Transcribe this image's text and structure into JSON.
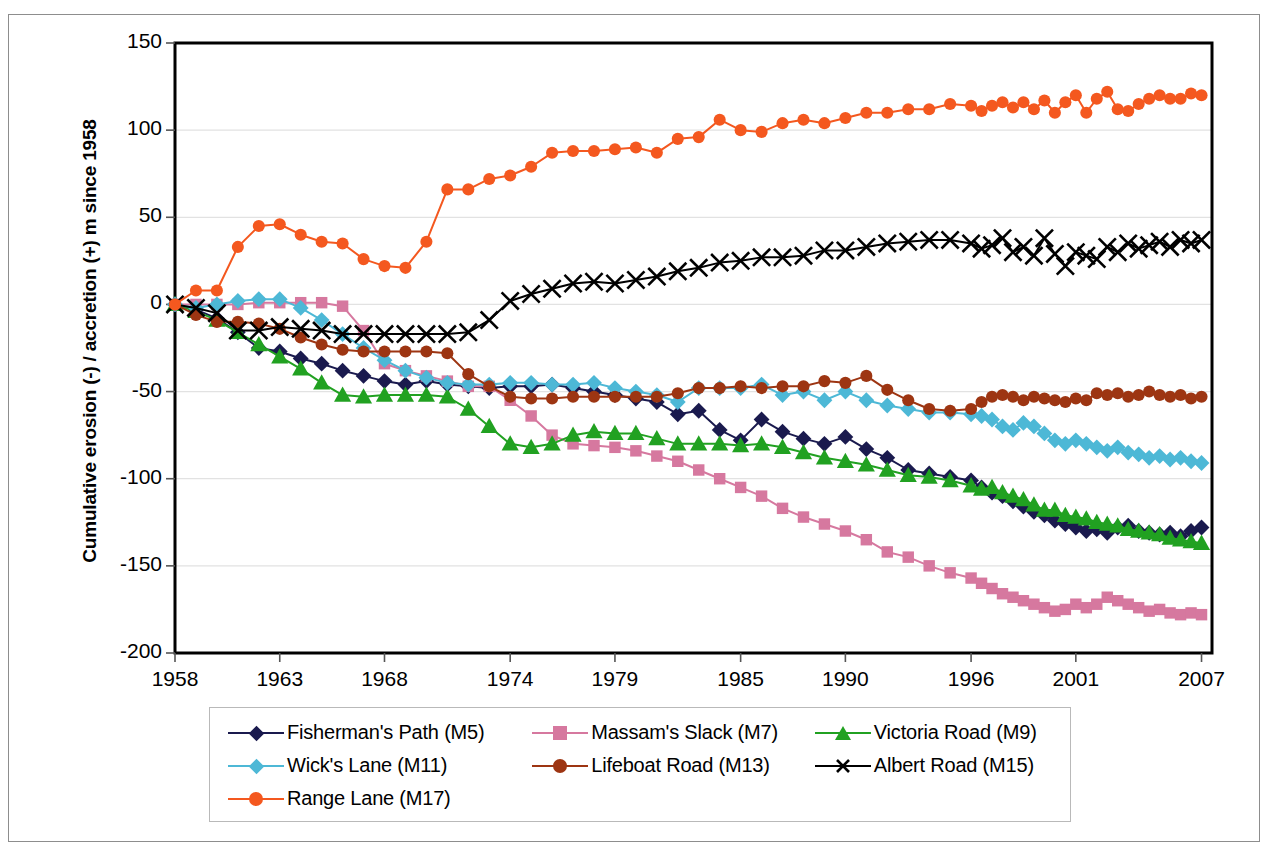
{
  "chart_data": {
    "type": "line",
    "title": "",
    "xlabel": "",
    "ylabel": "Cumulative erosion (-) / accretion (+) m since 1958",
    "xlim": [
      1958,
      2007.5
    ],
    "ylim": [
      -200,
      150
    ],
    "xticks": [
      "1958",
      "1963",
      "1968",
      "1974",
      "1979",
      "1985",
      "1990",
      "1996",
      "2001",
      "2007"
    ],
    "xtick_values": [
      1958,
      1963,
      1968,
      1974,
      1979,
      1985,
      1990,
      1996,
      2001,
      2007
    ],
    "yticks": [
      "150",
      "100",
      "50",
      "0",
      "-50",
      "-100",
      "-150",
      "-200"
    ],
    "ytick_values": [
      150,
      100,
      50,
      0,
      -50,
      -100,
      -150,
      -200
    ],
    "grid": "horizontal",
    "legend_position": "below",
    "series": [
      {
        "name": "Fisherman's Path (M5)",
        "color": "#1a1a4e",
        "marker": "diamond",
        "x": [
          1958,
          1959,
          1960,
          1961,
          1962,
          1963,
          1964,
          1965,
          1966,
          1967,
          1968,
          1969,
          1970,
          1971,
          1972,
          1973,
          1974,
          1975,
          1976,
          1977,
          1978,
          1979,
          1980,
          1981,
          1982,
          1983,
          1984,
          1985,
          1986,
          1987,
          1988,
          1989,
          1990,
          1991,
          1992,
          1993,
          1994,
          1995,
          1996,
          1996.5,
          1997,
          1997.5,
          1998,
          1998.5,
          1999,
          1999.5,
          2000,
          2000.5,
          2001,
          2001.5,
          2002,
          2002.5,
          2003,
          2003.5,
          2004,
          2004.5,
          2005,
          2005.5,
          2006,
          2006.5,
          2007
        ],
        "y": [
          0,
          -3,
          -8,
          -16,
          -25,
          -27,
          -31,
          -34,
          -38,
          -41,
          -44,
          -46,
          -44,
          -46,
          -47,
          -48,
          -47,
          -47,
          -46,
          -48,
          -50,
          -52,
          -54,
          -56,
          -63,
          -61,
          -72,
          -78,
          -66,
          -73,
          -77,
          -80,
          -76,
          -83,
          -88,
          -95,
          -97,
          -99,
          -101,
          -105,
          -108,
          -110,
          -113,
          -116,
          -119,
          -121,
          -124,
          -126,
          -128,
          -130,
          -129,
          -131,
          -128,
          -127,
          -130,
          -131,
          -132,
          -131,
          -133,
          -130,
          -128
        ]
      },
      {
        "name": "Massam's Slack (M7)",
        "color": "#d6789f",
        "marker": "square",
        "x": [
          1958,
          1959,
          1960,
          1961,
          1962,
          1963,
          1964,
          1965,
          1966,
          1967,
          1968,
          1969,
          1970,
          1971,
          1972,
          1973,
          1974,
          1975,
          1976,
          1977,
          1978,
          1979,
          1980,
          1981,
          1982,
          1983,
          1984,
          1985,
          1986,
          1987,
          1988,
          1989,
          1990,
          1991,
          1992,
          1993,
          1994,
          1995,
          1996,
          1996.5,
          1997,
          1997.5,
          1998,
          1998.5,
          1999,
          1999.5,
          2000,
          2000.5,
          2001,
          2001.5,
          2002,
          2002.5,
          2003,
          2003.5,
          2004,
          2004.5,
          2005,
          2005.5,
          2006,
          2006.5,
          2007
        ],
        "y": [
          0,
          0,
          0,
          0,
          1,
          1,
          1,
          1,
          -1,
          -15,
          -34,
          -38,
          -41,
          -44,
          -47,
          -47,
          -55,
          -64,
          -75,
          -80,
          -81,
          -82,
          -84,
          -87,
          -90,
          -95,
          -100,
          -105,
          -110,
          -117,
          -122,
          -126,
          -130,
          -135,
          -142,
          -145,
          -150,
          -154,
          -157,
          -160,
          -163,
          -166,
          -168,
          -170,
          -172,
          -174,
          -176,
          -175,
          -172,
          -174,
          -172,
          -168,
          -170,
          -172,
          -174,
          -176,
          -175,
          -177,
          -178,
          -177,
          -178
        ]
      },
      {
        "name": "Victoria Road (M9)",
        "color": "#21a121",
        "marker": "triangle",
        "x": [
          1958,
          1959,
          1960,
          1961,
          1962,
          1963,
          1964,
          1965,
          1966,
          1967,
          1968,
          1969,
          1970,
          1971,
          1972,
          1973,
          1974,
          1975,
          1976,
          1977,
          1978,
          1979,
          1980,
          1981,
          1982,
          1983,
          1984,
          1985,
          1986,
          1987,
          1988,
          1989,
          1990,
          1991,
          1992,
          1993,
          1994,
          1995,
          1996,
          1996.5,
          1997,
          1997.5,
          1998,
          1998.5,
          1999,
          1999.5,
          2000,
          2000.5,
          2001,
          2001.5,
          2002,
          2002.5,
          2003,
          2003.5,
          2004,
          2004.5,
          2005,
          2005.5,
          2006,
          2006.5,
          2007
        ],
        "y": [
          0,
          -4,
          -9,
          -16,
          -23,
          -30,
          -37,
          -45,
          -52,
          -53,
          -52,
          -52,
          -52,
          -53,
          -60,
          -70,
          -80,
          -82,
          -80,
          -75,
          -73,
          -74,
          -74,
          -77,
          -80,
          -80,
          -80,
          -81,
          -80,
          -82,
          -85,
          -88,
          -90,
          -92,
          -95,
          -98,
          -99,
          -101,
          -104,
          -106,
          -105,
          -108,
          -110,
          -112,
          -115,
          -118,
          -118,
          -121,
          -122,
          -123,
          -125,
          -126,
          -127,
          -129,
          -130,
          -131,
          -132,
          -134,
          -135,
          -136,
          -137
        ]
      },
      {
        "name": "Wick's Lane (M11)",
        "color": "#4db8d6",
        "marker": "diamond",
        "x": [
          1958,
          1959,
          1960,
          1961,
          1962,
          1963,
          1964,
          1965,
          1966,
          1967,
          1968,
          1969,
          1970,
          1971,
          1972,
          1973,
          1974,
          1975,
          1976,
          1977,
          1978,
          1979,
          1980,
          1981,
          1982,
          1983,
          1984,
          1985,
          1986,
          1987,
          1988,
          1989,
          1990,
          1991,
          1992,
          1993,
          1994,
          1995,
          1996,
          1996.5,
          1997,
          1997.5,
          1998,
          1998.5,
          1999,
          1999.5,
          2000,
          2000.5,
          2001,
          2001.5,
          2002,
          2002.5,
          2003,
          2003.5,
          2004,
          2004.5,
          2005,
          2005.5,
          2006,
          2006.5,
          2007
        ],
        "y": [
          0,
          -2,
          0,
          2,
          3,
          3,
          -2,
          -9,
          -17,
          -25,
          -32,
          -38,
          -42,
          -45,
          -46,
          -46,
          -45,
          -45,
          -46,
          -46,
          -45,
          -48,
          -50,
          -52,
          -56,
          -48,
          -48,
          -48,
          -46,
          -52,
          -50,
          -55,
          -50,
          -55,
          -58,
          -60,
          -62,
          -62,
          -63,
          -64,
          -66,
          -70,
          -72,
          -68,
          -70,
          -74,
          -78,
          -80,
          -78,
          -80,
          -82,
          -84,
          -82,
          -85,
          -86,
          -88,
          -87,
          -89,
          -88,
          -90,
          -91
        ]
      },
      {
        "name": "Lifeboat Road (M13)",
        "color": "#9d3512",
        "marker": "circle",
        "x": [
          1958,
          1959,
          1960,
          1961,
          1962,
          1963,
          1964,
          1965,
          1966,
          1967,
          1968,
          1969,
          1970,
          1971,
          1972,
          1973,
          1974,
          1975,
          1976,
          1977,
          1978,
          1979,
          1980,
          1981,
          1982,
          1983,
          1984,
          1985,
          1986,
          1987,
          1988,
          1989,
          1990,
          1991,
          1992,
          1993,
          1994,
          1995,
          1996,
          1996.5,
          1997,
          1997.5,
          1998,
          1998.5,
          1999,
          1999.5,
          2000,
          2000.5,
          2001,
          2001.5,
          2002,
          2002.5,
          2003,
          2003.5,
          2004,
          2004.5,
          2005,
          2005.5,
          2006,
          2006.5,
          2007
        ],
        "y": [
          0,
          -6,
          -10,
          -10,
          -11,
          -14,
          -19,
          -23,
          -26,
          -27,
          -27,
          -27,
          -27,
          -28,
          -40,
          -47,
          -53,
          -54,
          -54,
          -53,
          -53,
          -53,
          -53,
          -53,
          -51,
          -48,
          -48,
          -47,
          -48,
          -47,
          -47,
          -44,
          -45,
          -41,
          -49,
          -55,
          -60,
          -61,
          -60,
          -56,
          -53,
          -52,
          -53,
          -55,
          -53,
          -54,
          -55,
          -56,
          -54,
          -55,
          -51,
          -52,
          -51,
          -53,
          -52,
          -50,
          -52,
          -53,
          -52,
          -54,
          -53
        ]
      },
      {
        "name": "Albert Road (M15)",
        "color": "#000000",
        "marker": "cross",
        "x": [
          1958,
          1959,
          1960,
          1961,
          1962,
          1963,
          1964,
          1965,
          1966,
          1967,
          1968,
          1969,
          1970,
          1971,
          1972,
          1973,
          1974,
          1975,
          1976,
          1977,
          1978,
          1979,
          1980,
          1981,
          1982,
          1983,
          1984,
          1985,
          1986,
          1987,
          1988,
          1989,
          1990,
          1991,
          1992,
          1993,
          1994,
          1995,
          1996,
          1996.5,
          1997,
          1997.5,
          1998,
          1998.5,
          1999,
          1999.5,
          2000,
          2000.5,
          2001,
          2001.5,
          2002,
          2002.5,
          2003,
          2003.5,
          2004,
          2004.5,
          2005,
          2005.5,
          2006,
          2006.5,
          2007
        ],
        "y": [
          0,
          -2,
          -5,
          -15,
          -15,
          -13,
          -14,
          -15,
          -17,
          -17,
          -17,
          -17,
          -17,
          -17,
          -16,
          -9,
          2,
          6,
          9,
          12,
          13,
          12,
          14,
          16,
          19,
          21,
          24,
          25,
          27,
          27,
          28,
          31,
          31,
          33,
          35,
          36,
          37,
          37,
          35,
          32,
          34,
          38,
          30,
          33,
          28,
          38,
          29,
          22,
          30,
          28,
          26,
          33,
          30,
          35,
          32,
          34,
          36,
          33,
          37,
          35,
          37
        ]
      },
      {
        "name": "Range Lane (M17)",
        "color": "#f4581f",
        "marker": "circle",
        "x": [
          1958,
          1959,
          1960,
          1961,
          1962,
          1963,
          1964,
          1965,
          1966,
          1967,
          1968,
          1969,
          1970,
          1971,
          1972,
          1973,
          1974,
          1975,
          1976,
          1977,
          1978,
          1979,
          1980,
          1981,
          1982,
          1983,
          1984,
          1985,
          1986,
          1987,
          1988,
          1989,
          1990,
          1991,
          1992,
          1993,
          1994,
          1995,
          1996,
          1996.5,
          1997,
          1997.5,
          1998,
          1998.5,
          1999,
          1999.5,
          2000,
          2000.5,
          2001,
          2001.5,
          2002,
          2002.5,
          2003,
          2003.5,
          2004,
          2004.5,
          2005,
          2005.5,
          2006,
          2006.5,
          2007
        ],
        "y": [
          0,
          8,
          8,
          33,
          45,
          46,
          40,
          36,
          35,
          26,
          22,
          21,
          36,
          66,
          66,
          72,
          74,
          79,
          87,
          88,
          88,
          89,
          90,
          87,
          95,
          96,
          106,
          100,
          99,
          104,
          106,
          104,
          107,
          110,
          110,
          112,
          112,
          115,
          114,
          111,
          114,
          116,
          113,
          116,
          112,
          117,
          110,
          116,
          120,
          110,
          118,
          122,
          112,
          111,
          115,
          118,
          120,
          118,
          118,
          121,
          120
        ]
      }
    ]
  },
  "axis": {
    "y_title": "Cumulative erosion (-) / accretion (+) m since 1958"
  },
  "legend": {
    "rows": [
      [
        {
          "label": "Fisherman's Path (M5)",
          "color": "#1a1a4e",
          "marker": "diamond"
        },
        {
          "label": "Massam's Slack (M7)",
          "color": "#d6789f",
          "marker": "square"
        },
        {
          "label": "Victoria Road (M9)",
          "color": "#21a121",
          "marker": "triangle"
        }
      ],
      [
        {
          "label": "Wick's Lane (M11)",
          "color": "#4db8d6",
          "marker": "diamond"
        },
        {
          "label": "Lifeboat Road (M13)",
          "color": "#9d3512",
          "marker": "circle"
        },
        {
          "label": "Albert Road (M15)",
          "color": "#000000",
          "marker": "cross"
        }
      ],
      [
        {
          "label": "Range Lane (M17)",
          "color": "#f4581f",
          "marker": "circle"
        }
      ]
    ]
  }
}
